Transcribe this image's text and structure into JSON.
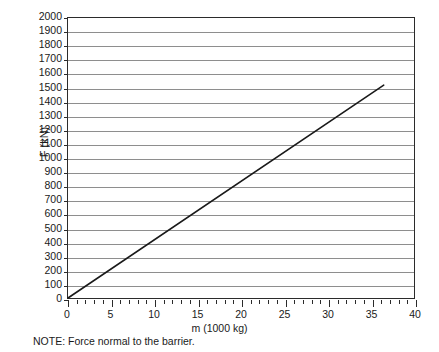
{
  "chart_data": {
    "type": "line",
    "title": "",
    "xlabel": "m (1000 kg)",
    "ylabel": "F (kN)",
    "xlim": [
      0,
      40
    ],
    "ylim": [
      0,
      2000
    ],
    "grid": true,
    "grid_axis": "y",
    "legend": false,
    "x_major_step": 5,
    "x_minor_step": 1,
    "y_major_step": 100,
    "x_tick_labels": [
      "0",
      "5",
      "10",
      "15",
      "20",
      "25",
      "30",
      "35",
      "40"
    ],
    "x_tick_values": [
      0,
      5,
      10,
      15,
      20,
      25,
      30,
      35,
      40
    ],
    "y_tick_labels": [
      "0",
      "100",
      "200",
      "300",
      "400",
      "500",
      "600",
      "700",
      "800",
      "900",
      "1000",
      "1100",
      "1200",
      "1300",
      "1400",
      "1500",
      "1600",
      "1700",
      "1800",
      "1900",
      "2000"
    ],
    "y_tick_values": [
      0,
      100,
      200,
      300,
      400,
      500,
      600,
      700,
      800,
      900,
      1000,
      1100,
      1200,
      1300,
      1400,
      1500,
      1600,
      1700,
      1800,
      1900,
      2000
    ],
    "series": [
      {
        "name": "Force vs mass",
        "color": "#1a1a1a",
        "line_width": 1.6,
        "points": [
          {
            "x": 0,
            "y": 0
          },
          {
            "x": 36.5,
            "y": 1520
          }
        ]
      }
    ],
    "annotations": [
      {
        "name": "note",
        "text": "NOTE: Force normal to the barrier."
      }
    ]
  },
  "figure": {
    "note_text": "NOTE: Force normal to the barrier.",
    "x_axis_title": "m (1000 kg)",
    "y_axis_title": "F (kN)",
    "grid_color": "#8e8e8e",
    "frame_color": "#2b2b2b",
    "series_color": "#1a1a1a",
    "background": "#ffffff"
  }
}
